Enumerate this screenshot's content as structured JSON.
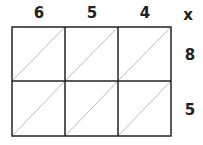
{
  "diagram": {
    "type": "lattice-multiplication-grid",
    "top_digits": [
      "6",
      "5",
      "4"
    ],
    "right_digits": [
      "8",
      "5"
    ],
    "operator": "x",
    "rows": 2,
    "cols": 3,
    "colors": {
      "grid": "#222222",
      "diagonal": "#aaaaaa",
      "text": "#222222"
    }
  }
}
